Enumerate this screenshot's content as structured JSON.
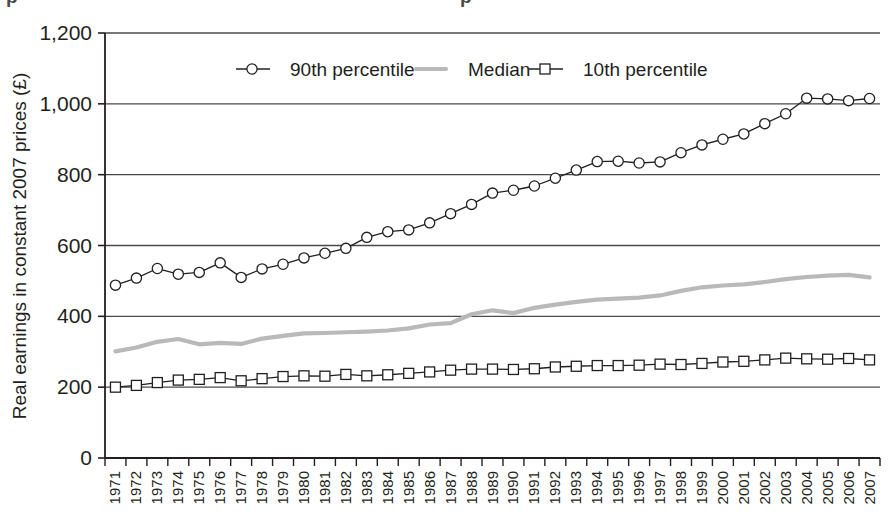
{
  "chart_data": {
    "type": "line",
    "title": "",
    "xlabel": "",
    "ylabel": "Real earnings in constant 2007 prices (£)",
    "ylim": [
      0,
      1200
    ],
    "yticks": [
      0,
      200,
      400,
      600,
      800,
      1000,
      1200
    ],
    "ytick_labels": [
      "0",
      "200",
      "400",
      "600",
      "800",
      "1,000",
      "1,200"
    ],
    "grid": true,
    "legend_position": "top-center",
    "categories": [
      "1971",
      "1972",
      "1973",
      "1974",
      "1975",
      "1976",
      "1977",
      "1978",
      "1979",
      "1980",
      "1981",
      "1982",
      "1983",
      "1984",
      "1985",
      "1986",
      "1987",
      "1988",
      "1989",
      "1990",
      "1991",
      "1992",
      "1993",
      "1994",
      "1995",
      "1996",
      "1997",
      "1998",
      "1999",
      "2000",
      "2001",
      "2002",
      "2003",
      "2004",
      "2005",
      "2006",
      "2007"
    ],
    "series": [
      {
        "name": "90th percentile",
        "marker": "circle",
        "color": "#231f20",
        "values": [
          488,
          508,
          535,
          519,
          524,
          551,
          510,
          534,
          547,
          565,
          578,
          592,
          623,
          639,
          644,
          664,
          690,
          716,
          748,
          756,
          768,
          790,
          813,
          837,
          838,
          833,
          836,
          862,
          884,
          900,
          915,
          944,
          972,
          1016,
          1014,
          1009,
          1015
        ]
      },
      {
        "name": "Median",
        "marker": "none",
        "color": "#b9b9b9",
        "values": [
          301,
          312,
          328,
          336,
          321,
          325,
          322,
          337,
          345,
          352,
          353,
          355,
          357,
          360,
          366,
          377,
          381,
          406,
          417,
          409,
          424,
          433,
          441,
          447,
          450,
          453,
          459,
          472,
          482,
          487,
          490,
          497,
          505,
          511,
          515,
          517,
          510
        ]
      },
      {
        "name": "10th percentile",
        "marker": "square",
        "color": "#231f20",
        "values": [
          200,
          205,
          213,
          220,
          222,
          227,
          218,
          224,
          230,
          232,
          231,
          236,
          232,
          235,
          239,
          243,
          248,
          251,
          251,
          250,
          252,
          257,
          259,
          261,
          261,
          262,
          265,
          264,
          267,
          271,
          273,
          277,
          282,
          280,
          279,
          281,
          277
        ]
      }
    ]
  },
  "legend": {
    "items": [
      {
        "label": "90th percentile",
        "marker": "circle"
      },
      {
        "label": "Median",
        "marker": "line"
      },
      {
        "label": "10th percentile",
        "marker": "square"
      }
    ]
  },
  "axes": {
    "y_title": "Real earnings in constant 2007 prices (£)"
  },
  "colors": {
    "axis": "#231f20",
    "grid": "#4a4a4a",
    "median": "#b9b9b9",
    "background": "#ffffff"
  },
  "cropped_header": {
    "fragment": "p"
  }
}
